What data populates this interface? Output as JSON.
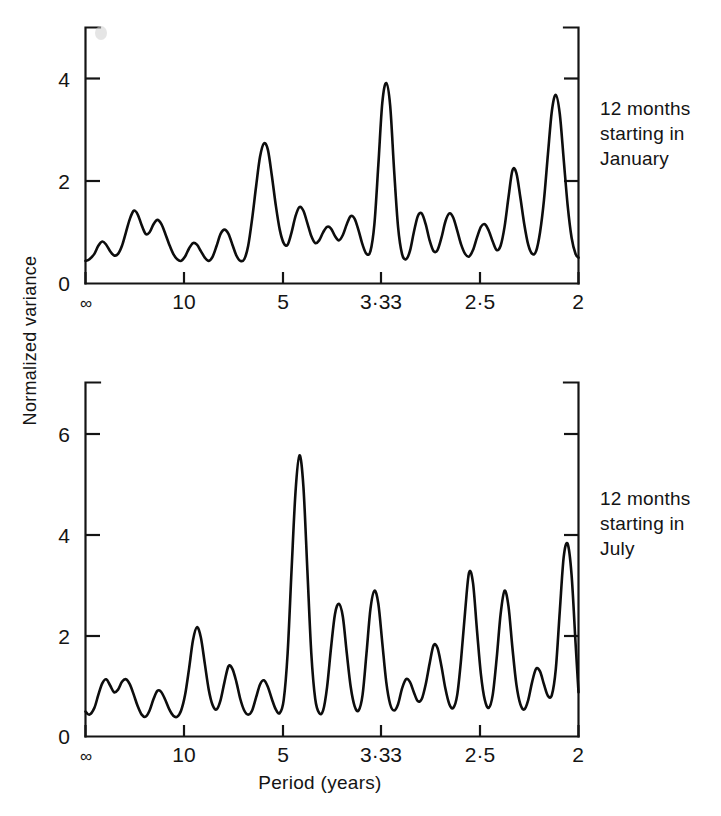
{
  "figure": {
    "xlabel": "Period (years)",
    "ylabel": "Normalized  variance",
    "annotation_top": "12 months\nstarting in\nJanuary",
    "annotation_bottom": "12 months\nstarting in\nJuly",
    "ink_color": "#141414",
    "background": "#ffffff"
  },
  "chart_data": [
    {
      "type": "line",
      "title": "12 months starting in January",
      "xlabel": "Period (years)",
      "ylabel": "Normalized variance",
      "xtick_labels": [
        "∞",
        "10",
        "5",
        "3·33",
        "2·5",
        "2"
      ],
      "xtick_frequency": [
        0,
        0.1,
        0.2,
        0.3,
        0.4,
        0.5
      ],
      "ytick_labels": [
        "0",
        "2",
        "4"
      ],
      "yticks": [
        0,
        2,
        4
      ],
      "ylim": [
        0,
        4.75
      ],
      "xlim_frequency": [
        0,
        0.5
      ],
      "grid": false,
      "legend": "none",
      "x": [
        0.0,
        0.004,
        0.009,
        0.013,
        0.017,
        0.021,
        0.025,
        0.029,
        0.033,
        0.037,
        0.041,
        0.045,
        0.049,
        0.053,
        0.057,
        0.061,
        0.065,
        0.069,
        0.073,
        0.077,
        0.081,
        0.085,
        0.089,
        0.093,
        0.097,
        0.101,
        0.105,
        0.109,
        0.113,
        0.117,
        0.121,
        0.125,
        0.129,
        0.133,
        0.137,
        0.141,
        0.145,
        0.149,
        0.153,
        0.157,
        0.161,
        0.165,
        0.169,
        0.173,
        0.177,
        0.181,
        0.185,
        0.189,
        0.193,
        0.197,
        0.201,
        0.205,
        0.209,
        0.213,
        0.217,
        0.221,
        0.225,
        0.229,
        0.233,
        0.237,
        0.241,
        0.245,
        0.249,
        0.253,
        0.257,
        0.261,
        0.265,
        0.269,
        0.273,
        0.277,
        0.281,
        0.285,
        0.289,
        0.293,
        0.297,
        0.301,
        0.305,
        0.309,
        0.313,
        0.317,
        0.321,
        0.325,
        0.329,
        0.333,
        0.337,
        0.341,
        0.345,
        0.349,
        0.353,
        0.357,
        0.361,
        0.365,
        0.369,
        0.373,
        0.377,
        0.381,
        0.385,
        0.389,
        0.393,
        0.397,
        0.401,
        0.405,
        0.409,
        0.413,
        0.417,
        0.421,
        0.425,
        0.429,
        0.433,
        0.437,
        0.441,
        0.445,
        0.449,
        0.453,
        0.457,
        0.461,
        0.465,
        0.469,
        0.473,
        0.477,
        0.481,
        0.485,
        0.489,
        0.493,
        0.497,
        0.5
      ],
      "values": [
        0.42,
        0.45,
        0.55,
        0.7,
        0.78,
        0.72,
        0.6,
        0.52,
        0.55,
        0.7,
        0.95,
        1.2,
        1.35,
        1.28,
        1.08,
        0.92,
        0.95,
        1.1,
        1.18,
        1.1,
        0.92,
        0.72,
        0.55,
        0.45,
        0.42,
        0.5,
        0.65,
        0.75,
        0.72,
        0.6,
        0.48,
        0.42,
        0.5,
        0.7,
        0.92,
        1.0,
        0.92,
        0.72,
        0.52,
        0.42,
        0.45,
        0.7,
        1.2,
        1.8,
        2.35,
        2.6,
        2.48,
        2.0,
        1.45,
        1.0,
        0.75,
        0.72,
        0.95,
        1.25,
        1.42,
        1.35,
        1.12,
        0.88,
        0.75,
        0.8,
        0.95,
        1.05,
        1.02,
        0.88,
        0.8,
        0.9,
        1.1,
        1.25,
        1.2,
        0.98,
        0.72,
        0.55,
        0.6,
        1.1,
        2.2,
        3.35,
        3.72,
        3.3,
        2.1,
        1.05,
        0.55,
        0.45,
        0.6,
        0.95,
        1.25,
        1.3,
        1.1,
        0.8,
        0.6,
        0.62,
        0.85,
        1.15,
        1.3,
        1.22,
        0.98,
        0.72,
        0.55,
        0.5,
        0.62,
        0.85,
        1.05,
        1.1,
        0.98,
        0.78,
        0.62,
        0.7,
        1.05,
        1.6,
        2.1,
        2.05,
        1.6,
        1.1,
        0.72,
        0.55,
        0.6,
        0.95,
        1.55,
        2.4,
        3.2,
        3.5,
        3.15,
        2.3,
        1.45,
        0.85,
        0.55,
        0.48
      ],
      "peaks_described": [
        {
          "x_frequency": 0.045,
          "value": 1.35
        },
        {
          "x_frequency": 0.069,
          "value": 1.18
        },
        {
          "x_frequency": 0.141,
          "value": 1.0
        },
        {
          "x_frequency": 0.181,
          "value": 2.6
        },
        {
          "x_frequency": 0.217,
          "value": 1.42
        },
        {
          "x_frequency": 0.269,
          "value": 1.25
        },
        {
          "x_frequency": 0.305,
          "value": 3.72
        },
        {
          "x_frequency": 0.341,
          "value": 1.3
        },
        {
          "x_frequency": 0.369,
          "value": 1.3
        },
        {
          "x_frequency": 0.441,
          "value": 2.1
        },
        {
          "x_frequency": 0.485,
          "value": 3.5
        }
      ]
    },
    {
      "type": "line",
      "title": "12 months starting in July",
      "xlabel": "Period (years)",
      "ylabel": "Normalized variance",
      "xtick_labels": [
        "∞",
        "10",
        "5",
        "3·33",
        "2·5",
        "2"
      ],
      "xtick_frequency": [
        0,
        0.1,
        0.2,
        0.3,
        0.4,
        0.5
      ],
      "ytick_labels": [
        "0",
        "2",
        "4",
        "6"
      ],
      "yticks": [
        0,
        2,
        4,
        6
      ],
      "ylim": [
        0,
        6.8
      ],
      "xlim_frequency": [
        0,
        0.5
      ],
      "grid": false,
      "legend": "none",
      "x": [
        0.0,
        0.004,
        0.009,
        0.013,
        0.017,
        0.021,
        0.025,
        0.029,
        0.033,
        0.037,
        0.041,
        0.045,
        0.049,
        0.053,
        0.057,
        0.061,
        0.065,
        0.069,
        0.073,
        0.077,
        0.081,
        0.085,
        0.089,
        0.093,
        0.097,
        0.101,
        0.105,
        0.109,
        0.113,
        0.117,
        0.121,
        0.125,
        0.129,
        0.133,
        0.137,
        0.141,
        0.145,
        0.149,
        0.153,
        0.157,
        0.161,
        0.165,
        0.169,
        0.173,
        0.177,
        0.181,
        0.185,
        0.189,
        0.193,
        0.197,
        0.201,
        0.205,
        0.209,
        0.213,
        0.217,
        0.221,
        0.225,
        0.229,
        0.233,
        0.237,
        0.241,
        0.245,
        0.249,
        0.253,
        0.257,
        0.261,
        0.265,
        0.269,
        0.273,
        0.277,
        0.281,
        0.285,
        0.289,
        0.293,
        0.297,
        0.301,
        0.305,
        0.309,
        0.313,
        0.317,
        0.321,
        0.325,
        0.329,
        0.333,
        0.337,
        0.341,
        0.345,
        0.349,
        0.353,
        0.357,
        0.361,
        0.365,
        0.369,
        0.373,
        0.377,
        0.381,
        0.385,
        0.389,
        0.393,
        0.397,
        0.401,
        0.405,
        0.409,
        0.413,
        0.417,
        0.421,
        0.425,
        0.429,
        0.433,
        0.437,
        0.441,
        0.445,
        0.449,
        0.453,
        0.457,
        0.461,
        0.465,
        0.469,
        0.473,
        0.477,
        0.481,
        0.485,
        0.489,
        0.493,
        0.497,
        0.5
      ],
      "values": [
        0.48,
        0.42,
        0.55,
        0.8,
        1.02,
        1.1,
        0.98,
        0.85,
        0.9,
        1.05,
        1.1,
        1.0,
        0.8,
        0.58,
        0.42,
        0.38,
        0.5,
        0.72,
        0.88,
        0.85,
        0.7,
        0.52,
        0.4,
        0.38,
        0.5,
        0.8,
        1.3,
        1.85,
        2.1,
        1.9,
        1.4,
        0.9,
        0.6,
        0.52,
        0.7,
        1.05,
        1.35,
        1.3,
        1.05,
        0.72,
        0.5,
        0.42,
        0.5,
        0.75,
        1.0,
        1.08,
        0.95,
        0.72,
        0.52,
        0.45,
        0.7,
        1.6,
        3.2,
        4.7,
        5.4,
        4.8,
        3.2,
        1.6,
        0.72,
        0.45,
        0.5,
        0.95,
        1.7,
        2.35,
        2.55,
        2.3,
        1.6,
        0.95,
        0.58,
        0.5,
        0.8,
        1.6,
        2.45,
        2.8,
        2.55,
        1.8,
        1.05,
        0.62,
        0.5,
        0.62,
        0.92,
        1.1,
        1.05,
        0.85,
        0.68,
        0.72,
        1.0,
        1.4,
        1.75,
        1.7,
        1.35,
        0.92,
        0.62,
        0.55,
        0.8,
        1.5,
        2.4,
        3.15,
        2.95,
        2.05,
        1.2,
        0.7,
        0.55,
        0.8,
        1.5,
        2.35,
        2.8,
        2.5,
        1.7,
        1.0,
        0.62,
        0.52,
        0.7,
        1.05,
        1.3,
        1.25,
        1.0,
        0.78,
        0.8,
        1.3,
        2.4,
        3.45,
        3.7,
        3.1,
        1.8,
        0.85,
        0.55,
        0.6
      ],
      "peaks_described": [
        {
          "x_frequency": 0.021,
          "value": 1.1
        },
        {
          "x_frequency": 0.041,
          "value": 1.1
        },
        {
          "x_frequency": 0.073,
          "value": 0.88
        },
        {
          "x_frequency": 0.113,
          "value": 2.1
        },
        {
          "x_frequency": 0.145,
          "value": 1.35
        },
        {
          "x_frequency": 0.181,
          "value": 1.08
        },
        {
          "x_frequency": 0.217,
          "value": 5.4
        },
        {
          "x_frequency": 0.257,
          "value": 2.55
        },
        {
          "x_frequency": 0.293,
          "value": 2.8
        },
        {
          "x_frequency": 0.325,
          "value": 1.1
        },
        {
          "x_frequency": 0.357,
          "value": 1.75
        },
        {
          "x_frequency": 0.393,
          "value": 3.15
        },
        {
          "x_frequency": 0.429,
          "value": 2.8
        },
        {
          "x_frequency": 0.461,
          "value": 1.3
        },
        {
          "x_frequency": 0.489,
          "value": 3.7
        }
      ]
    }
  ]
}
